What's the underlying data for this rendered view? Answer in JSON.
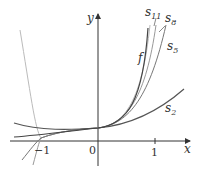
{
  "figure": {
    "axes": {
      "x_label": "x",
      "y_label": "y",
      "origin_label": "0",
      "x_ticks": [
        {
          "value": -1,
          "label": "−1"
        },
        {
          "value": 1,
          "label": "1"
        }
      ]
    },
    "curves": [
      {
        "name": "f",
        "label": "f",
        "color": "#555555"
      },
      {
        "name": "s2",
        "label": "s",
        "sub": "2",
        "color": "#555555"
      },
      {
        "name": "s5",
        "label": "s",
        "sub": "5",
        "color": "#777777"
      },
      {
        "name": "s8",
        "label": "s",
        "sub": "8",
        "color": "#999999"
      },
      {
        "name": "s11",
        "label": "s",
        "sub": "11",
        "color": "#aaaaaa"
      }
    ]
  }
}
